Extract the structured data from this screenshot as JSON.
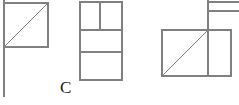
{
  "figure": {
    "type": "line-drawing",
    "canvas": {
      "width": 239,
      "height": 105,
      "background": "#ffffff"
    },
    "stroke": {
      "color": "#808080",
      "width": 1.1
    },
    "label": {
      "text": "C",
      "x": 60,
      "y": 79,
      "color": "#1a1a1a",
      "font_size": 17
    },
    "views": [
      {
        "name": "left-view",
        "shapes": [
          {
            "kind": "rect",
            "x": 4,
            "y": 3,
            "width": 44,
            "height": 44
          },
          {
            "kind": "line",
            "x1": 4,
            "y1": 47,
            "x2": 48,
            "y2": 3
          },
          {
            "kind": "line",
            "x1": 4,
            "y1": 0,
            "x2": 4,
            "y2": 97
          }
        ]
      },
      {
        "name": "middle-view",
        "shapes": [
          {
            "kind": "rect",
            "x": 80,
            "y": 2,
            "width": 42,
            "height": 78
          },
          {
            "kind": "line",
            "x1": 80,
            "y1": 30,
            "x2": 122,
            "y2": 30
          },
          {
            "kind": "line",
            "x1": 80,
            "y1": 52,
            "x2": 122,
            "y2": 52
          },
          {
            "kind": "line",
            "x1": 100,
            "y1": 2,
            "x2": 100,
            "y2": 30
          }
        ]
      },
      {
        "name": "right-view",
        "shapes": [
          {
            "kind": "rect",
            "x": 162,
            "y": 30,
            "width": 69,
            "height": 46
          },
          {
            "kind": "line",
            "x1": 162,
            "y1": 76,
            "x2": 208,
            "y2": 30
          },
          {
            "kind": "line",
            "x1": 208,
            "y1": 0,
            "x2": 208,
            "y2": 76
          },
          {
            "kind": "line",
            "x1": 208,
            "y1": 2,
            "x2": 239,
            "y2": 2
          },
          {
            "kind": "line",
            "x1": 208,
            "y1": 11,
            "x2": 239,
            "y2": 11
          },
          {
            "kind": "line",
            "x1": 231,
            "y1": 30,
            "x2": 231,
            "y2": 76
          }
        ]
      }
    ]
  }
}
